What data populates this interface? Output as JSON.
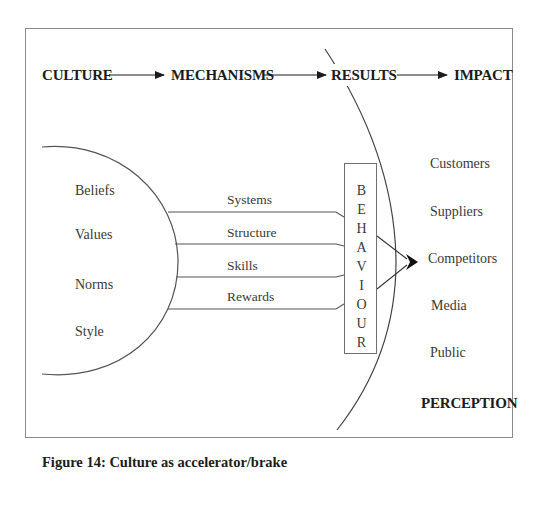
{
  "header": {
    "stages": [
      "CULTURE",
      "MECHANISMS",
      "RESULTS",
      "IMPACT"
    ]
  },
  "culture": {
    "items": [
      "Beliefs",
      "Values",
      "Norms",
      "Style"
    ]
  },
  "mechanisms": {
    "items": [
      "Systems",
      "Structure",
      "Skills",
      "Rewards"
    ]
  },
  "behaviour": {
    "letters": [
      "B",
      "E",
      "H",
      "A",
      "V",
      "I",
      "O",
      "U",
      "R"
    ],
    "word": "BEHAVIOUR"
  },
  "impact": {
    "items": [
      "Customers",
      "Suppliers",
      "Competitors",
      "Media",
      "Public"
    ],
    "footer_label": "PERCEPTION"
  },
  "caption": "Figure 14: Culture as accelerator/brake",
  "colors": {
    "line": "#555555",
    "text": "#2a2a2a",
    "frame": "#8a8a8a"
  }
}
